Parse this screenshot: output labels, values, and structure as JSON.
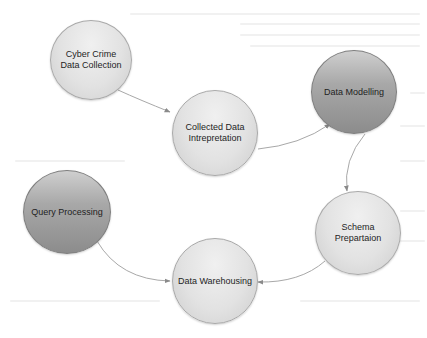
{
  "diagram": {
    "type": "process-cycle",
    "nodes": [
      {
        "id": "n1",
        "label": "Cyber Crime Data Collection",
        "style": "light"
      },
      {
        "id": "n2",
        "label": "Collected Data Intrepretation",
        "style": "light"
      },
      {
        "id": "n3",
        "label": "Data Modelling",
        "style": "dark"
      },
      {
        "id": "n4",
        "label": "Schema Prepartaion",
        "style": "light"
      },
      {
        "id": "n5",
        "label": "Data Warehousing",
        "style": "light"
      },
      {
        "id": "n6",
        "label": "Query Processing",
        "style": "dark"
      }
    ],
    "edges": [
      {
        "from": "n1",
        "to": "n2"
      },
      {
        "from": "n2",
        "to": "n3"
      },
      {
        "from": "n3",
        "to": "n4"
      },
      {
        "from": "n4",
        "to": "n5"
      },
      {
        "from": "n6",
        "to": "n5"
      }
    ],
    "colors": {
      "light_node": "#e2e2e2",
      "dark_node": "#9a9a9a",
      "edge": "#9a9a9a",
      "text": "#1e1e1e"
    }
  }
}
